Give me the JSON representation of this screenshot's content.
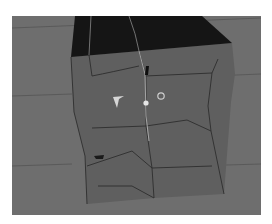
{
  "viewport": {
    "label": "3D viewport",
    "colors": {
      "background": "#6e6e6e",
      "cube_top": "#141414",
      "cube_front": "#5e5e5e",
      "edges": "#2a2a2a",
      "highlight_edge": "#a8a8a8"
    },
    "object": "subdivided cube mesh",
    "gizmos": [
      "move-gizmo-arrow",
      "pivot-point",
      "rotate-circle-handle"
    ]
  }
}
